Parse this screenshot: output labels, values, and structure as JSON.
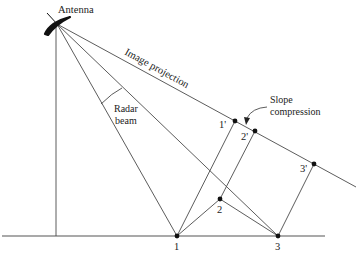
{
  "diagram": {
    "type": "radar-geometry",
    "title": "",
    "labels": {
      "antenna": "Antenna",
      "image_projection": "Image projection",
      "radar_beam_line1": "Radar",
      "radar_beam_line2": "beam",
      "slope_compression_line1": "Slope",
      "slope_compression_line2": "compression"
    },
    "ground_points": [
      {
        "id": "1",
        "label": "1"
      },
      {
        "id": "2",
        "label": "2"
      },
      {
        "id": "3",
        "label": "3"
      }
    ],
    "image_points": [
      {
        "id": "1p",
        "label": "1'"
      },
      {
        "id": "2p",
        "label": "2'"
      },
      {
        "id": "3p",
        "label": "3'"
      }
    ],
    "colors": {
      "line": "#4a4a4a",
      "point": "#111111",
      "antenna": "#111111",
      "background": "#ffffff"
    }
  }
}
